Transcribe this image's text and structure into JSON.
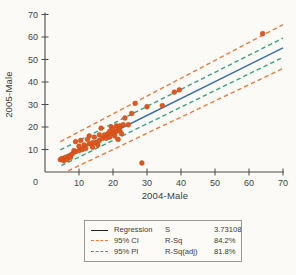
{
  "chart_data": {
    "type": "scatter",
    "xlabel": "2004-Male",
    "ylabel": "2005-Male",
    "xlim": [
      0,
      70
    ],
    "ylim": [
      0,
      70
    ],
    "xticks": [
      10,
      20,
      30,
      40,
      50,
      60,
      70
    ],
    "yticks": [
      10,
      20,
      30,
      40,
      50,
      60,
      70
    ],
    "origin_label": "0",
    "grid": "off",
    "point_color": "#e2571e",
    "point_edge_color": "#bf4a15",
    "points": [
      [
        4.5,
        5.5
      ],
      [
        5,
        6
      ],
      [
        5.5,
        5
      ],
      [
        6,
        6.5
      ],
      [
        6.5,
        5.5
      ],
      [
        7,
        7
      ],
      [
        7.5,
        6.5
      ],
      [
        8,
        8
      ],
      [
        8.5,
        9.5
      ],
      [
        9,
        9
      ],
      [
        9,
        13.5
      ],
      [
        10,
        9.5
      ],
      [
        10,
        11.5
      ],
      [
        10.5,
        14
      ],
      [
        11,
        10
      ],
      [
        11.5,
        12
      ],
      [
        12,
        10.5
      ],
      [
        12.5,
        14.5
      ],
      [
        13,
        12.5
      ],
      [
        13,
        16
      ],
      [
        14,
        11
      ],
      [
        14,
        13
      ],
      [
        14.5,
        15.5
      ],
      [
        15,
        13
      ],
      [
        15.5,
        12
      ],
      [
        16,
        16.5
      ],
      [
        16,
        14
      ],
      [
        16.5,
        19.5
      ],
      [
        17,
        15
      ],
      [
        17.5,
        16.5
      ],
      [
        18,
        15
      ],
      [
        18.5,
        17
      ],
      [
        19,
        15.5
      ],
      [
        19,
        18
      ],
      [
        19.5,
        20
      ],
      [
        20,
        17
      ],
      [
        20,
        19
      ],
      [
        20.5,
        16
      ],
      [
        21,
        20.5
      ],
      [
        21,
        18
      ],
      [
        21.5,
        19
      ],
      [
        21.5,
        14.5
      ],
      [
        22,
        18.5
      ],
      [
        22,
        20.5
      ],
      [
        22.5,
        17
      ],
      [
        23,
        21
      ],
      [
        23.5,
        24
      ],
      [
        24.5,
        21
      ],
      [
        25.5,
        26
      ],
      [
        26.5,
        30.5
      ],
      [
        28.5,
        4
      ],
      [
        30,
        29
      ],
      [
        34.5,
        29.5
      ],
      [
        38,
        35.5
      ],
      [
        39.5,
        36.5
      ],
      [
        64,
        61.5
      ]
    ],
    "lines": [
      {
        "name": "regression",
        "label": "Regression",
        "style": "solid",
        "color": "#3a6cb0",
        "x1": 4.5,
        "y1": 6.0,
        "x2": 70,
        "y2": 55.2
      },
      {
        "name": "ci-upper",
        "label": "95% CI",
        "style": "dashed",
        "color": "#e87c3e",
        "x1": 4.5,
        "y1": 13.5,
        "x2": 70,
        "y2": 65.5
      },
      {
        "name": "ci-lower",
        "label": "95% CI",
        "style": "dashed",
        "color": "#e87c3e",
        "x1": 6.8,
        "y1": 0.5,
        "x2": 70,
        "y2": 46.0
      },
      {
        "name": "pi-upper",
        "label": "95% PI",
        "style": "dashed",
        "color": "#3d9f85",
        "x1": 4.5,
        "y1": 9.8,
        "x2": 70,
        "y2": 59.5
      },
      {
        "name": "pi-lower",
        "label": "95% PI",
        "style": "dashed",
        "color": "#3d9f85",
        "x1": 4.8,
        "y1": 2.8,
        "x2": 70,
        "y2": 51.0
      }
    ],
    "legend": {
      "position": "bottom",
      "entries": [
        {
          "label": "Regression",
          "style": "solid",
          "color": "#222222"
        },
        {
          "label": "95% CI",
          "style": "dashed",
          "color": "#e87c3e"
        },
        {
          "label": "95% PI",
          "style": "dashed",
          "color": "#3d9f85"
        }
      ],
      "stats": [
        {
          "name": "S",
          "value": "3.73108"
        },
        {
          "name": "R-Sq",
          "value": "84.2%"
        },
        {
          "name": "R-Sq(adj)",
          "value": "81.8%"
        }
      ]
    }
  }
}
